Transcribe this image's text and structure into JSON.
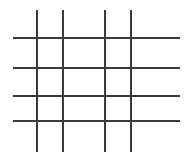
{
  "figure": {
    "name": "line-grid-figure",
    "type": "grid",
    "width": 184,
    "height": 166,
    "background_color": "#ffffff",
    "line_color": "#3a3a3a",
    "line_width_px": 2
  },
  "chart_data": {
    "type": "line",
    "title": "",
    "subtitle": "",
    "xlabel": "",
    "ylabel": "",
    "grid": true,
    "legend": null,
    "annotations": [],
    "vertical_line_count": 4,
    "horizontal_line_count": 4,
    "cell_count": 9,
    "series": [
      {
        "name": "vertical-lines",
        "orientation": "vertical",
        "color": "#3a3a3a",
        "extent_start": 10,
        "extent_end": 152,
        "positions": [
          37,
          63,
          105,
          131
        ]
      },
      {
        "name": "horizontal-lines",
        "orientation": "horizontal",
        "color": "#3a3a3a",
        "extent_start": 13,
        "extent_end": 180,
        "positions": [
          38,
          68,
          96,
          121
        ]
      }
    ]
  }
}
